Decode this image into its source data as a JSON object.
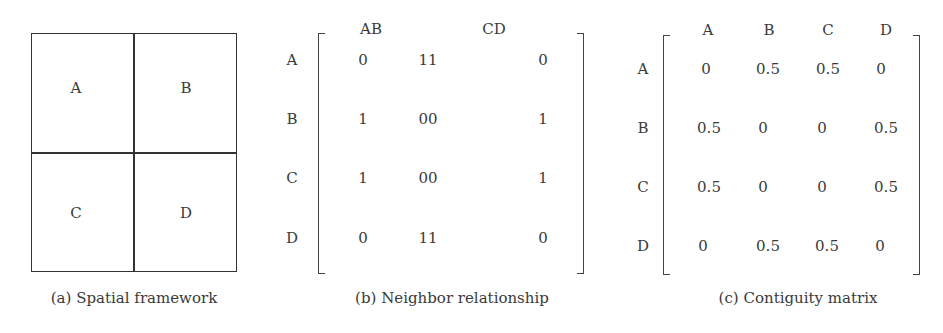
{
  "panels": {
    "a": {
      "caption": "(a) Spatial framework",
      "cells": [
        "A",
        "B",
        "C",
        "D"
      ]
    },
    "b": {
      "caption": "(b) Neighbor relationship",
      "col_headers": [
        "AB",
        "CD"
      ],
      "row_labels": [
        "A",
        "B",
        "C",
        "D"
      ],
      "rows": [
        [
          "0",
          "11",
          "0"
        ],
        [
          "1",
          "00",
          "1"
        ],
        [
          "1",
          "00",
          "1"
        ],
        [
          "0",
          "11",
          "0"
        ]
      ]
    },
    "c": {
      "caption": "(c) Contiguity matrix",
      "col_headers": [
        "A",
        "B",
        "C",
        "D"
      ],
      "row_labels": [
        "A",
        "B",
        "C",
        "D"
      ],
      "rows": [
        [
          "0",
          "0.5",
          "0.5",
          "0"
        ],
        [
          "0.5",
          "0",
          "0",
          "0.5"
        ],
        [
          "0.5",
          "0",
          "0",
          "0.5"
        ],
        [
          "0",
          "0.5",
          "0.5",
          "0"
        ]
      ]
    }
  }
}
